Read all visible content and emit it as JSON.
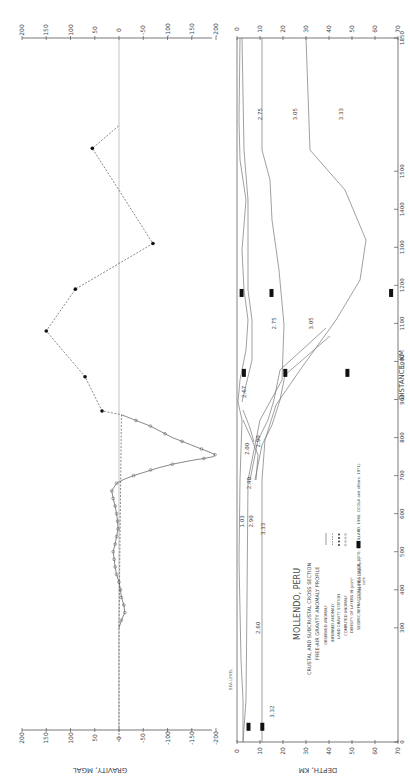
{
  "figure": {
    "title": "MOLLENDO, PERU",
    "subtitle_1": "CRUSTAL AND SUBCRUSTAL CROSS SECTION",
    "subtitle_2": "FREE-AIR GRAVITY ANOMALY PROFILE",
    "legend": [
      {
        "label": "OBSERVED ANOMALY",
        "symbol": "solid-line"
      },
      {
        "label": "INFERRED ANOMALY",
        "symbol": "dashed-line"
      },
      {
        "label": "LAND GRAVITY STATION",
        "symbol": "filled-dots"
      },
      {
        "label": "COMPUTED ANOMALY",
        "symbol": "open-circles"
      },
      {
        "label": "DENSITY OF LAYERS IN g/cm³",
        "symbol": "number"
      },
      {
        "label": "SEISMIC REFRACTION LINES (SHOR, 1970; WOOLLARD, 1960; OCOLA and others, 1971)",
        "symbol": "black-bar"
      }
    ],
    "credit_1": "OREGON STATE UNIVERSITY",
    "credit_2": "1976",
    "sea_level_label": "SEA LEVEL"
  },
  "chart_data": [
    {
      "type": "line",
      "title": "FREE-AIR GRAVITY ANOMALY PROFILE",
      "xlabel": "DISTANCE, KM",
      "ylabel": "GRAVITY, MGAL",
      "orientation": "rotated-90-cw",
      "xlim": [
        0,
        1850
      ],
      "ylim": [
        -200,
        200
      ],
      "gravity_ticks": [
        "200",
        "150",
        "100",
        "50",
        "0",
        "-50",
        "-100",
        "-150",
        "-200"
      ],
      "distance_ticks": [
        "0",
        "300",
        "400",
        "500",
        "600",
        "700",
        "800",
        "900",
        "1000",
        "1100",
        "1200",
        "1300",
        "1400",
        "1500",
        "1850"
      ],
      "series": [
        {
          "name": "Observed anomaly",
          "style": "solid",
          "x": [
            300,
            320,
            340,
            360,
            380,
            400,
            420,
            440,
            460,
            480,
            500,
            520,
            540,
            560,
            580,
            600,
            620,
            640,
            660,
            680,
            690,
            700,
            710,
            720,
            730,
            740,
            745,
            750,
            755,
            760,
            770,
            780,
            790,
            800,
            810,
            820,
            830,
            840,
            850,
            860
          ],
          "values": [
            0,
            -5,
            -12,
            -10,
            -5,
            -3,
            0,
            5,
            8,
            10,
            12,
            8,
            5,
            2,
            3,
            5,
            8,
            12,
            15,
            5,
            -10,
            -30,
            -55,
            -80,
            -110,
            -150,
            -175,
            -195,
            -198,
            -190,
            -170,
            -150,
            -130,
            -110,
            -95,
            -80,
            -65,
            -45,
            -25,
            -5
          ]
        },
        {
          "name": "Inferred anomaly",
          "style": "dashed",
          "x": [
            0,
            300,
            860,
            870,
            960,
            1080,
            1190,
            1310,
            1560,
            1620
          ],
          "values": [
            0,
            0,
            -5,
            35,
            70,
            150,
            90,
            -70,
            55,
            0
          ]
        },
        {
          "name": "Land gravity station",
          "style": "filled-dots",
          "x": [
            870,
            960,
            1080,
            1190,
            1310,
            1560
          ],
          "values": [
            35,
            70,
            150,
            90,
            -70,
            55
          ]
        },
        {
          "name": "Computed anomaly",
          "style": "open-circles",
          "x": [
            320,
            340,
            360,
            380,
            400,
            420,
            440,
            460,
            480,
            500,
            520,
            540,
            560,
            580,
            600,
            620,
            640,
            660,
            680,
            700,
            715,
            730,
            745,
            755,
            770,
            790,
            810,
            830,
            845
          ],
          "values": [
            -5,
            -12,
            -10,
            -5,
            -3,
            0,
            5,
            8,
            10,
            12,
            8,
            5,
            2,
            3,
            5,
            8,
            12,
            15,
            5,
            -30,
            -65,
            -110,
            -175,
            -198,
            -170,
            -130,
            -95,
            -65,
            -35
          ]
        }
      ]
    },
    {
      "type": "area",
      "title": "CRUSTAL AND SUBCRUSTAL CROSS SECTION",
      "xlabel": "DISTANCE, KM",
      "ylabel": "DEPTH, KM",
      "orientation": "rotated-90-cw",
      "xlim": [
        0,
        1850
      ],
      "ylim": [
        0,
        70
      ],
      "depth_ticks": [
        "0",
        "10",
        "20",
        "30",
        "40",
        "50",
        "60",
        "70"
      ],
      "density_labels": [
        {
          "value": "3.32",
          "distance": 80,
          "depth": 16
        },
        {
          "value": "2.60",
          "distance": 300,
          "depth": 10
        },
        {
          "value": "1.03",
          "distance": 580,
          "depth": 3
        },
        {
          "value": "2.90",
          "distance": 580,
          "depth": 7
        },
        {
          "value": "3.33",
          "distance": 560,
          "depth": 12
        },
        {
          "value": "2.40",
          "distance": 680,
          "depth": 6
        },
        {
          "value": "2.00",
          "distance": 770,
          "depth": 5
        },
        {
          "value": "2.90",
          "distance": 790,
          "depth": 10
        },
        {
          "value": "2.67",
          "distance": 920,
          "depth": 4
        },
        {
          "value": "2.75",
          "distance": 1100,
          "depth": 17
        },
        {
          "value": "3.05",
          "distance": 1100,
          "depth": 33
        },
        {
          "value": "2.75",
          "distance": 1650,
          "depth": 11
        },
        {
          "value": "3.05",
          "distance": 1650,
          "depth": 26
        },
        {
          "value": "3.33",
          "distance": 1650,
          "depth": 46
        }
      ],
      "annotations": [
        "PERU-CHILE TRENCH",
        "SEA LEVEL",
        "TRENCH AXIS"
      ],
      "seismic_refraction_bars": [
        {
          "distance": 40,
          "depth": 5
        },
        {
          "distance": 40,
          "depth": 11
        },
        {
          "distance": 970,
          "depth": 3
        },
        {
          "distance": 970,
          "depth": 21
        },
        {
          "distance": 970,
          "depth": 48
        },
        {
          "distance": 1180,
          "depth": 2
        },
        {
          "distance": 1180,
          "depth": 15
        },
        {
          "distance": 1180,
          "depth": 67
        }
      ]
    }
  ]
}
